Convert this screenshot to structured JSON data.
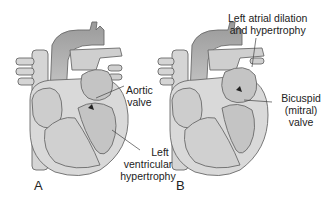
{
  "figure": {
    "panels": [
      {
        "letter": "A",
        "labels": [
          {
            "line1": "Aortic",
            "line2": "valve"
          },
          {
            "line1": "Left",
            "line2": "ventricular",
            "line3": "hypertrophy"
          }
        ]
      },
      {
        "letter": "B",
        "labels": [
          {
            "line1": "Left atrial dilation",
            "line2": "and hypertrophy"
          },
          {
            "line1": "Bicuspid",
            "line2": "(mitral) valve"
          }
        ]
      }
    ],
    "colors": {
      "outline": "#6a6a6a",
      "fill_light": "#d9d9d9",
      "fill_mid": "#c4c4c4",
      "vessel_dark": "#8a8a8a",
      "label_text": "#222222"
    }
  }
}
